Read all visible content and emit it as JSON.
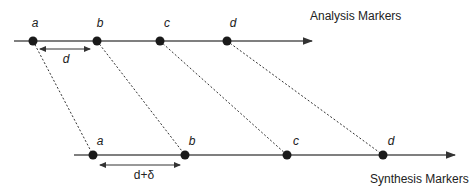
{
  "diagram": {
    "analysis_title": "Analysis Markers",
    "synthesis_title": "Synthesis Markers",
    "analysis_markers": [
      {
        "label": "a",
        "x": 33
      },
      {
        "label": "b",
        "x": 97
      },
      {
        "label": "c",
        "x": 160
      },
      {
        "label": "d",
        "x": 227
      }
    ],
    "synthesis_markers": [
      {
        "label": "a",
        "x": 93
      },
      {
        "label": "b",
        "x": 185
      },
      {
        "label": "c",
        "x": 287
      },
      {
        "label": "d",
        "x": 383
      }
    ],
    "analysis_spacing_label": "d",
    "synthesis_spacing_label": "d+δ",
    "colors": {
      "line": "#555555",
      "marker": "#1a1a1a",
      "text": "#222222"
    }
  }
}
